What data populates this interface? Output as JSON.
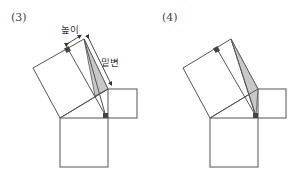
{
  "figures": [
    {
      "label": "(3)",
      "annotations": {
        "height_label": "높이",
        "base_label": "밑변"
      },
      "shaded_region": "triangle",
      "shade_color": "#c8c8c8"
    },
    {
      "label": "(4)",
      "annotations": {},
      "shaded_region": "triangle",
      "shade_color": "#c8c8c8"
    }
  ]
}
